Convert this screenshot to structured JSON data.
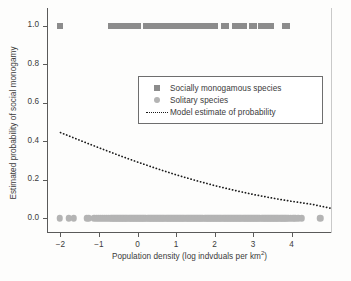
{
  "chart_data": {
    "type": "scatter",
    "title": "",
    "xlabel": "Population density (log indvduals per km²)",
    "xlabel_base": "Population density (log indvduals per km",
    "xlabel_sup": "2",
    "xlabel_tail": ")",
    "ylabel": "Estimated probability of social monogamy",
    "xlim": [
      -2.35,
      5.05
    ],
    "ylim": [
      -0.045,
      1.06
    ],
    "grid": false,
    "legend_position": "upper-center-right",
    "xticks": [
      -2,
      -1,
      0,
      1,
      2,
      3,
      4
    ],
    "xtick_labels": [
      "−2",
      "−1",
      "0",
      "1",
      "2",
      "3",
      "4"
    ],
    "yticks": [
      0.0,
      0.2,
      0.4,
      0.6,
      0.8,
      1.0
    ],
    "ytick_labels": [
      "0.0",
      "0.2",
      "0.4",
      "0.6",
      "0.8",
      "1.0"
    ],
    "series": [
      {
        "name": "Socially monogamous species",
        "marker": "square",
        "color": "#8c8c8c",
        "y_value": 1.0,
        "x": [
          -2.02,
          -0.7,
          -0.64,
          -0.58,
          -0.52,
          -0.4,
          -0.34,
          -0.27,
          -0.16,
          -0.1,
          -0.04,
          0.02,
          0.22,
          0.28,
          0.34,
          0.4,
          0.46,
          0.52,
          0.58,
          0.64,
          0.7,
          0.76,
          0.82,
          0.88,
          0.94,
          1.0,
          1.06,
          1.12,
          1.18,
          1.24,
          1.3,
          1.36,
          1.42,
          1.48,
          1.54,
          1.6,
          1.66,
          1.72,
          1.78,
          1.84,
          1.9,
          1.96,
          2.02,
          2.24,
          2.3,
          2.52,
          2.58,
          2.64,
          2.7,
          2.76,
          2.96,
          3.02,
          3.2,
          3.26,
          3.4,
          3.46,
          3.82,
          3.88
        ]
      },
      {
        "name": "Solitary species",
        "marker": "circle",
        "color": "#b4b4b4",
        "y_value": 0.0,
        "x": [
          -2.02,
          -1.78,
          -1.66,
          -1.32,
          -1.26,
          -1.12,
          -1.06,
          -1.0,
          -0.95,
          -0.9,
          -0.85,
          -0.8,
          -0.75,
          -0.7,
          -0.66,
          -0.62,
          -0.58,
          -0.54,
          -0.5,
          -0.46,
          -0.42,
          -0.38,
          -0.34,
          -0.3,
          -0.26,
          -0.22,
          -0.18,
          -0.14,
          -0.1,
          -0.06,
          -0.02,
          0.02,
          0.06,
          0.1,
          0.14,
          0.18,
          0.22,
          0.26,
          0.3,
          0.34,
          0.38,
          0.42,
          0.46,
          0.5,
          0.54,
          0.58,
          0.62,
          0.66,
          0.7,
          0.74,
          0.78,
          0.82,
          0.86,
          0.9,
          0.94,
          0.98,
          1.02,
          1.06,
          1.1,
          1.14,
          1.18,
          1.22,
          1.26,
          1.3,
          1.34,
          1.38,
          1.42,
          1.46,
          1.5,
          1.54,
          1.58,
          1.62,
          1.66,
          1.7,
          1.74,
          1.78,
          1.82,
          1.86,
          1.9,
          1.94,
          1.98,
          2.02,
          2.06,
          2.1,
          2.14,
          2.18,
          2.22,
          2.26,
          2.3,
          2.34,
          2.38,
          2.42,
          2.46,
          2.5,
          2.54,
          2.58,
          2.62,
          2.66,
          2.7,
          2.74,
          2.78,
          2.82,
          2.86,
          2.9,
          2.94,
          2.98,
          3.02,
          3.06,
          3.1,
          3.14,
          3.18,
          3.22,
          3.26,
          3.3,
          3.34,
          3.38,
          3.42,
          3.46,
          3.5,
          3.54,
          3.58,
          3.62,
          3.66,
          3.7,
          3.74,
          3.78,
          3.82,
          3.86,
          3.92,
          3.98,
          4.04,
          4.1,
          4.18,
          4.26,
          4.75
        ]
      }
    ],
    "model_curve": {
      "name": "Model estimate of probability",
      "style": "dotted",
      "color": "#1a1a1a",
      "x": [
        -2.0,
        -1.5,
        -1.0,
        -0.5,
        0.0,
        0.5,
        1.0,
        1.5,
        2.0,
        2.5,
        3.0,
        3.5,
        4.0,
        4.5,
        5.0
      ],
      "y": [
        0.445,
        0.405,
        0.366,
        0.328,
        0.292,
        0.258,
        0.226,
        0.197,
        0.17,
        0.146,
        0.124,
        0.105,
        0.088,
        0.074,
        0.053
      ]
    }
  },
  "legend": {
    "entries": [
      {
        "label": "Socially monogamous species",
        "key": "square"
      },
      {
        "label": "Solitary species",
        "key": "circle"
      },
      {
        "label": "Model estimate of probability",
        "key": "dotted-line"
      }
    ]
  }
}
